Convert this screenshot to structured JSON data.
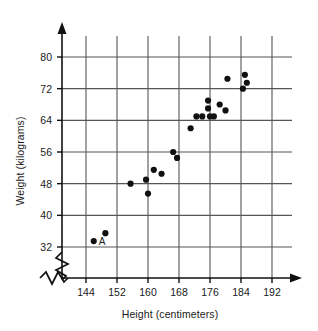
{
  "chart_data": {
    "type": "scatter",
    "title": "",
    "xlabel": "Height (centimeters)",
    "ylabel": "Weight (kilograms)",
    "xticks": [
      144,
      152,
      160,
      168,
      176,
      184,
      192
    ],
    "yticks": [
      32,
      40,
      48,
      56,
      64,
      72,
      80
    ],
    "xlim": [
      140,
      196
    ],
    "ylim": [
      28,
      84
    ],
    "grid": true,
    "axis_break_x": true,
    "axis_break_y": true,
    "legend": "none",
    "point_color": "#111111",
    "grid_color": "#555555",
    "axis_color": "#111111",
    "points": [
      {
        "x": 146.0,
        "y": 33.5,
        "label": "A"
      },
      {
        "x": 149.0,
        "y": 35.5,
        "label": ""
      },
      {
        "x": 155.5,
        "y": 48.0,
        "label": ""
      },
      {
        "x": 159.5,
        "y": 49.0,
        "label": ""
      },
      {
        "x": 160.0,
        "y": 45.5,
        "label": ""
      },
      {
        "x": 161.5,
        "y": 51.5,
        "label": ""
      },
      {
        "x": 163.5,
        "y": 50.5,
        "label": ""
      },
      {
        "x": 166.5,
        "y": 56.0,
        "label": ""
      },
      {
        "x": 167.5,
        "y": 54.5,
        "label": ""
      },
      {
        "x": 171.0,
        "y": 62.0,
        "label": ""
      },
      {
        "x": 172.5,
        "y": 65.0,
        "label": ""
      },
      {
        "x": 174.0,
        "y": 65.0,
        "label": ""
      },
      {
        "x": 176.0,
        "y": 65.0,
        "label": ""
      },
      {
        "x": 177.0,
        "y": 65.0,
        "label": ""
      },
      {
        "x": 175.5,
        "y": 67.0,
        "label": ""
      },
      {
        "x": 175.5,
        "y": 69.0,
        "label": ""
      },
      {
        "x": 178.5,
        "y": 68.0,
        "label": ""
      },
      {
        "x": 180.0,
        "y": 66.5,
        "label": ""
      },
      {
        "x": 180.5,
        "y": 74.5,
        "label": ""
      },
      {
        "x": 185.0,
        "y": 75.5,
        "label": ""
      },
      {
        "x": 185.5,
        "y": 73.5,
        "label": ""
      },
      {
        "x": 184.5,
        "y": 72.0,
        "label": ""
      }
    ],
    "point_labels": [
      {
        "text": "A",
        "x": 146.0,
        "y": 33.5
      }
    ]
  }
}
